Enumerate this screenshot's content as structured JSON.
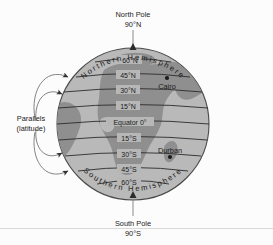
{
  "figure": {
    "colors": {
      "ocean": "#b9b9b9",
      "land": "#8f8f8f",
      "globe_outline": "#4a4a4a",
      "parallel_line": "#2b2b2b",
      "text": "#1b1b1b",
      "callout_line": "#6e6e6e",
      "panel_background": "#fcfcfc",
      "divider": "#d8d8d8"
    },
    "poles": {
      "north": {
        "name": "North Pole",
        "value": "90°N"
      },
      "south": {
        "name": "South Pole",
        "value": "90°S"
      }
    },
    "hemispheres": {
      "northern": "Northern Hemisphere",
      "southern": "Southern Hemisphere"
    },
    "callout": {
      "line1": "Parallels",
      "line2": "(latitude)"
    },
    "equator_label": "Equator 0°",
    "parallels": [
      {
        "label": "60°N",
        "latitude": 60,
        "hemisphere": "N"
      },
      {
        "label": "45°N",
        "latitude": 45,
        "hemisphere": "N"
      },
      {
        "label": "30°N",
        "latitude": 30,
        "hemisphere": "N"
      },
      {
        "label": "15°N",
        "latitude": 15,
        "hemisphere": "N"
      },
      {
        "label": "Equator 0°",
        "latitude": 0,
        "hemisphere": ""
      },
      {
        "label": "15°S",
        "latitude": -15,
        "hemisphere": "S"
      },
      {
        "label": "30°S",
        "latitude": -30,
        "hemisphere": "S"
      },
      {
        "label": "45°S",
        "latitude": -45,
        "hemisphere": "S"
      },
      {
        "label": "60°S",
        "latitude": -60,
        "hemisphere": "S"
      }
    ],
    "cities": [
      {
        "name": "Cairo",
        "hemisphere": "Northern",
        "near_parallel": "30°N"
      },
      {
        "name": "Durban",
        "hemisphere": "Southern",
        "near_parallel": "30°S"
      }
    ]
  }
}
